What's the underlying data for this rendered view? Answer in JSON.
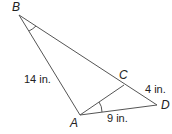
{
  "figure": {
    "vertices": {
      "A": "A",
      "B": "B",
      "C": "C",
      "D": "D"
    },
    "lengths": {
      "AB": "14 in.",
      "CD": "4 in.",
      "AD": "9 in."
    },
    "line_color": "#555555",
    "text_color": "#222222",
    "marked_angles": [
      "angle ABD",
      "angle CAD"
    ]
  }
}
